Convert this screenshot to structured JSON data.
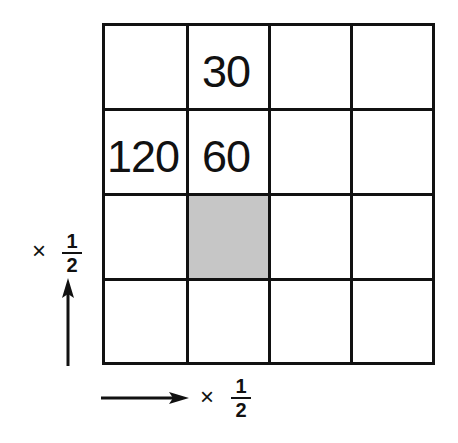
{
  "grid": {
    "rows": 4,
    "cols": 4,
    "cells": [
      [
        "",
        "30",
        "",
        ""
      ],
      [
        "120",
        "60",
        "",
        ""
      ],
      [
        "",
        "",
        "",
        ""
      ],
      [
        "",
        "",
        "",
        ""
      ]
    ],
    "shaded_cell": {
      "row": 2,
      "col": 1
    },
    "shade_color": "#c6c6c6",
    "line_color": "#111111"
  },
  "labels": {
    "vertical_factor": {
      "times": "×",
      "numerator": "1",
      "denominator": "2"
    },
    "horizontal_factor": {
      "times": "×",
      "numerator": "1",
      "denominator": "2"
    }
  },
  "arrows": {
    "vertical": "up",
    "horizontal": "right"
  }
}
